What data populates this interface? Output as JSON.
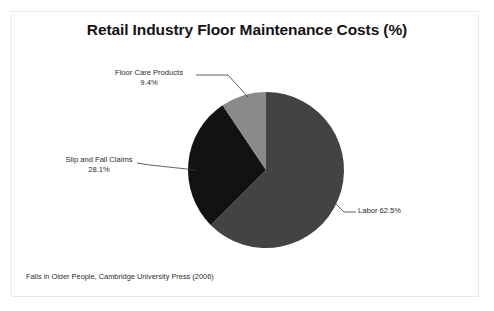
{
  "title": "Retail Industry Floor Maintenance Costs (%)",
  "footer": "Falls in Older People, Cambridge University Press (2006)",
  "labels": {
    "labor": "Labor 62.5%",
    "slip_name": "Slip and Fall Claims",
    "slip_value": "28.1%",
    "floor_name": "Floor Care Products",
    "floor_value": "9.4%"
  },
  "colors": {
    "labor": "#434343",
    "slip": "#121212",
    "floor": "#8a8a8a",
    "background": "#ffffff",
    "frame": "#e9e9e9",
    "leader": "#3a3a3a",
    "text": "#1a1a1a"
  },
  "chart_data": {
    "type": "pie",
    "title": "Retail Industry Floor Maintenance Costs (%)",
    "subtitle": "",
    "xlabel": "",
    "ylabel": "",
    "unit": "%",
    "start_angle": 90,
    "direction": "clockwise",
    "grid": false,
    "legend": "none",
    "labels_position": "outside-with-leader-lines",
    "annotations": [
      "Falls in Older People, Cambridge University Press (2006)"
    ],
    "categories": [
      "Labor",
      "Slip and Fall Claims",
      "Floor Care Products"
    ],
    "values": [
      62.5,
      28.1,
      9.4
    ],
    "slices": [
      {
        "label": "Labor",
        "value": 62.5,
        "display": "Labor 62.5%",
        "color": "#434343"
      },
      {
        "label": "Slip and Fall Claims",
        "value": 28.1,
        "display": "28.1%",
        "color": "#121212"
      },
      {
        "label": "Floor Care Products",
        "value": 9.4,
        "display": "9.4%",
        "color": "#8a8a8a"
      }
    ],
    "total": 100.0
  }
}
